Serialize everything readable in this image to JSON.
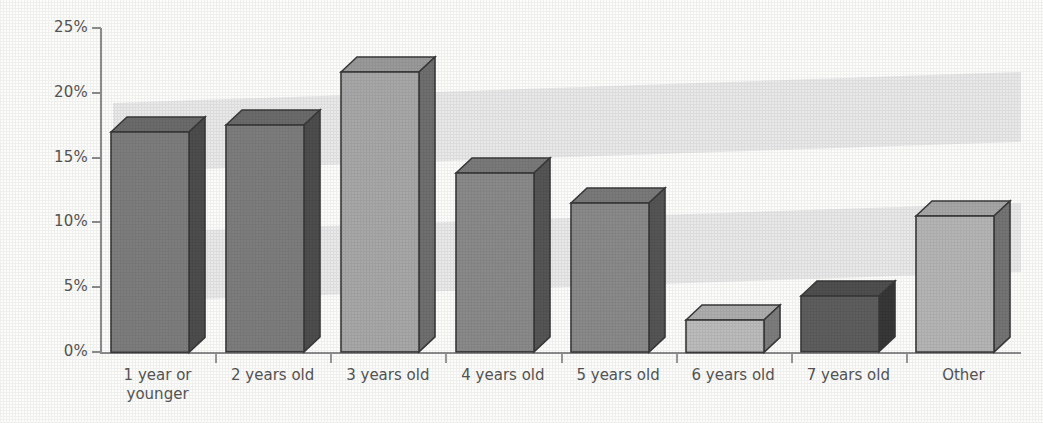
{
  "chart_data": {
    "type": "bar",
    "title": "",
    "subtitle": "",
    "xlabel": "",
    "ylabel": "",
    "categories": [
      "1 year or\nyounger",
      "2 years old",
      "3 years old",
      "4 years old",
      "5 years old",
      "6 years old",
      "7 years old",
      "Other"
    ],
    "values": [
      17.0,
      17.5,
      21.6,
      13.8,
      11.5,
      2.5,
      4.3,
      10.5
    ],
    "value_labels": [
      "17.0%",
      "17.5%",
      "21.6%",
      "13.8%",
      "11.5%",
      "2.5%",
      "4.3%",
      "10.5%"
    ],
    "ylim": [
      0,
      25
    ],
    "ytick_labels": [
      "0%",
      "5%",
      "10%",
      "15%",
      "20%",
      "25%"
    ],
    "ytick_values": [
      0,
      5,
      10,
      15,
      20,
      25
    ],
    "grid": false,
    "legend": "none",
    "style": "3d-bar",
    "bar_colors": [
      "#7d7d7d",
      "#7d7d7d",
      "#a8a8a8",
      "#8a8a8a",
      "#8a8a8a",
      "#bcbcbc",
      "#5e5e5e",
      "#b5b5b5"
    ],
    "bar_top_colors": [
      "#6b6b6b",
      "#6b6b6b",
      "#9a9a9a",
      "#7a7a7a",
      "#7a7a7a",
      "#aeaeae",
      "#4f4f4f",
      "#a7a7a7"
    ],
    "bar_side_colors": [
      "#4d4d4d",
      "#4d4d4d",
      "#6f6f6f",
      "#555555",
      "#555555",
      "#7d7d7d",
      "#373737",
      "#747474"
    ],
    "background_color": "#fdfdfc",
    "band_color": "#e9e9e9",
    "axis_color": "#8d8d8d"
  }
}
